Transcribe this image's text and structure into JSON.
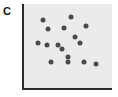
{
  "figure": {
    "panel_label": "C",
    "background_color": "#ffffff",
    "plot_background_color": "#ebebeb",
    "axis_color": "#2b2b2b",
    "point_color": "#4a4a4a"
  },
  "chart_data": {
    "type": "scatter",
    "title": "C",
    "xlabel": "",
    "ylabel": "",
    "xtick_labels": [],
    "ytick_labels": [],
    "grid": false,
    "legend": null,
    "axes_shown": [
      "left",
      "bottom"
    ],
    "xlim": [
      0,
      1
    ],
    "ylim": [
      0,
      1
    ],
    "n_points": 16,
    "series": [
      {
        "name": "points",
        "marker": "circle",
        "marker_color": "#4a4a4a",
        "marker_size_px": 5,
        "points_px": [
          {
            "x": 43,
            "y": 20
          },
          {
            "x": 71,
            "y": 17
          },
          {
            "x": 48,
            "y": 29
          },
          {
            "x": 64,
            "y": 28
          },
          {
            "x": 86,
            "y": 26
          },
          {
            "x": 75,
            "y": 37
          },
          {
            "x": 38,
            "y": 43
          },
          {
            "x": 47,
            "y": 45
          },
          {
            "x": 58,
            "y": 45
          },
          {
            "x": 80,
            "y": 43
          },
          {
            "x": 62,
            "y": 49
          },
          {
            "x": 68,
            "y": 57
          },
          {
            "x": 51,
            "y": 62
          },
          {
            "x": 68,
            "y": 62
          },
          {
            "x": 84,
            "y": 62
          },
          {
            "x": 96,
            "y": 64
          }
        ],
        "x": [
          0.23,
          0.54,
          0.29,
          0.47,
          0.72,
          0.59,
          0.18,
          0.28,
          0.4,
          0.65,
          0.45,
          0.52,
          0.33,
          0.52,
          0.7,
          0.84
        ],
        "y": [
          0.81,
          0.85,
          0.7,
          0.71,
          0.74,
          0.61,
          0.54,
          0.51,
          0.51,
          0.54,
          0.46,
          0.37,
          0.31,
          0.31,
          0.31,
          0.29
        ]
      }
    ]
  }
}
